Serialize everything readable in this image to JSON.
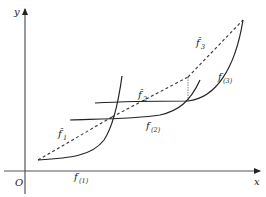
{
  "diagram": {
    "axes": {
      "x_label": "x",
      "y_label": "y",
      "origin_label": "O"
    },
    "curves": [
      {
        "id": "f1",
        "label": "f",
        "subscript": "(1)",
        "style": "solid"
      },
      {
        "id": "f2",
        "label": "f",
        "subscript": "(2)",
        "style": "solid"
      },
      {
        "id": "f3",
        "label": "f",
        "subscript": "(3)",
        "style": "solid"
      }
    ],
    "secants": [
      {
        "id": "fhat1",
        "label": "f̂",
        "subscript": "1",
        "style": "dashed"
      },
      {
        "id": "fhat2",
        "label": "f̂",
        "subscript": "2",
        "style": "dashed"
      },
      {
        "id": "fhat3",
        "label": "f̂",
        "subscript": "3",
        "style": "dashed"
      }
    ],
    "colors": {
      "curve": "#222222",
      "axis": "#555555",
      "background": "#ffffff"
    }
  }
}
